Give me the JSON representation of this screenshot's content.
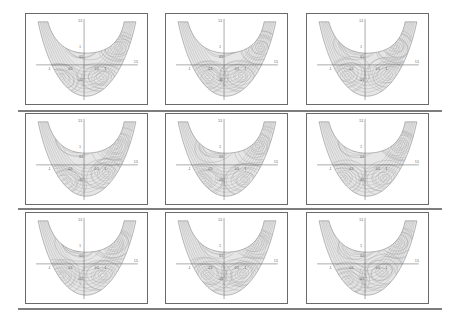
{
  "figure": {
    "rows": 3,
    "cols": 3,
    "colors": {
      "background": "#ffffff",
      "frame": "#6a6a6a",
      "separator": "#7d7d7d",
      "region_fill": "#e4e4e4",
      "contour_line": "#9a9a9a",
      "axis": "#555555"
    },
    "axis_labels": {
      "x_ticks": [
        "-1",
        "-0.5",
        "0.5",
        "1",
        "1.5"
      ],
      "y_ticks": [
        "1.5",
        "1",
        "0.5",
        "-0.5"
      ]
    },
    "panels": [
      {
        "id": "r1c1",
        "row": 1,
        "col": 1
      },
      {
        "id": "r1c2",
        "row": 1,
        "col": 2
      },
      {
        "id": "r1c3",
        "row": 1,
        "col": 3
      },
      {
        "id": "r2c1",
        "row": 2,
        "col": 1
      },
      {
        "id": "r2c2",
        "row": 2,
        "col": 2
      },
      {
        "id": "r2c3",
        "row": 2,
        "col": 3
      },
      {
        "id": "r3c1",
        "row": 3,
        "col": 1
      },
      {
        "id": "r3c2",
        "row": 3,
        "col": 2
      },
      {
        "id": "r3c3",
        "row": 3,
        "col": 3
      }
    ]
  }
}
